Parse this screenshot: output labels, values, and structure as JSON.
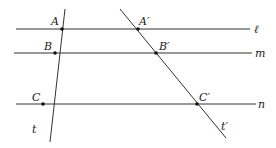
{
  "diagram": {
    "colors": {
      "line": "#333333",
      "point": "#111111",
      "background": "#ffffff"
    },
    "parallel_lines": [
      {
        "name": "ℓ",
        "x1": 16,
        "y1": 29,
        "x2": 250,
        "y2": 29,
        "label_x": 254,
        "label_y": 33
      },
      {
        "name": "m",
        "x1": 14,
        "y1": 53,
        "x2": 252,
        "y2": 53,
        "label_x": 255,
        "label_y": 57
      },
      {
        "name": "n",
        "x1": 16,
        "y1": 104,
        "x2": 256,
        "y2": 104,
        "label_x": 258,
        "label_y": 108
      }
    ],
    "transversals": [
      {
        "name": "t",
        "x1": 65,
        "y1": 9,
        "x2": 50,
        "y2": 142,
        "label_x": 32,
        "label_y": 133
      },
      {
        "name": "t′",
        "x1": 120,
        "y1": 9,
        "x2": 226,
        "y2": 138,
        "label_x": 221,
        "label_y": 130
      }
    ],
    "points": [
      {
        "name": "A",
        "x": 62,
        "y": 29,
        "label_x": 51,
        "label_y": 25
      },
      {
        "name": "B",
        "x": 55,
        "y": 53,
        "label_x": 44,
        "label_y": 50
      },
      {
        "name": "C",
        "x": 43,
        "y": 104,
        "label_x": 32,
        "label_y": 101
      },
      {
        "name": "A′",
        "x": 138,
        "y": 29,
        "label_x": 139,
        "label_y": 25
      },
      {
        "name": "B′",
        "x": 156,
        "y": 53,
        "label_x": 159,
        "label_y": 50
      },
      {
        "name": "C′",
        "x": 197,
        "y": 104,
        "label_x": 199,
        "label_y": 101
      }
    ]
  }
}
